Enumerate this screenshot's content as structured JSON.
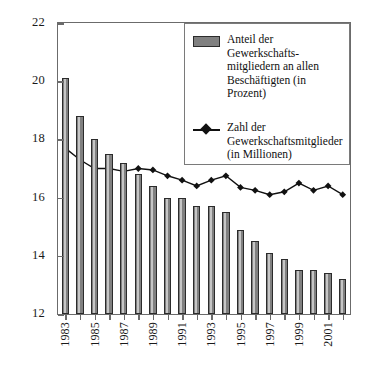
{
  "chart_data": {
    "type": "bar",
    "title": "",
    "subtitle": "",
    "xlabel": "",
    "ylabel": "",
    "ylim": [
      12,
      22
    ],
    "ytick_step": 2,
    "ytick_labels": [
      "12",
      "14",
      "16",
      "18",
      "20",
      "22"
    ],
    "grid": false,
    "legend_position": "top-right-inside",
    "x": [
      1983,
      1984,
      1985,
      1986,
      1987,
      1988,
      1989,
      1990,
      1991,
      1992,
      1993,
      1994,
      1995,
      1996,
      1997,
      1998,
      1999,
      2000,
      2001,
      2002
    ],
    "categories": [
      "1983",
      "1984",
      "1985",
      "1986",
      "1987",
      "1988",
      "1989",
      "1990",
      "1991",
      "1992",
      "1993",
      "1994",
      "1995",
      "1996",
      "1997",
      "1998",
      "1999",
      "2000",
      "2001",
      "2002"
    ],
    "xtick_labels_shown": [
      "1983",
      "1985",
      "1987",
      "1989",
      "1991",
      "1993",
      "1995",
      "1997",
      "1999",
      "2001"
    ],
    "series": [
      {
        "name": "Anteil der Gewerkschaftsmitgliedern an allen Beschäftigten (in Prozent)",
        "type": "bar",
        "unit": "Prozent",
        "color": "#808080",
        "values": [
          20.1,
          18.8,
          18.0,
          17.5,
          17.2,
          16.8,
          16.4,
          16.0,
          16.0,
          15.7,
          15.7,
          15.5,
          14.9,
          14.5,
          14.1,
          13.9,
          13.5,
          13.5,
          13.4,
          13.2
        ]
      },
      {
        "name": "Zahl der Gewerkschaftsmitglieder (in Millionen)",
        "type": "line",
        "unit": "Millionen",
        "color": "#111111",
        "marker": "diamond",
        "values": [
          17.7,
          17.3,
          17.0,
          17.0,
          16.9,
          17.0,
          16.95,
          16.75,
          16.6,
          16.4,
          16.6,
          16.75,
          16.35,
          16.25,
          16.1,
          16.2,
          16.5,
          16.25,
          16.4,
          16.1
        ]
      }
    ]
  },
  "legend": {
    "entries": [
      {
        "icon": "bar-swatch",
        "lines": [
          "Anteil der Gewerkschafts-",
          "mitgliedern an allen",
          "Beschäftigten (in Prozent)"
        ]
      },
      {
        "icon": "line-marker-swatch",
        "lines": [
          "Zahl der",
          "Gewerkschaftsmitglieder",
          "(in Millionen)"
        ]
      }
    ]
  },
  "colors": {
    "bar_fill": "#808080",
    "bar_edge": "#2b2b2b",
    "line": "#111111",
    "axis": "#6b6b6b",
    "background": "#ffffff"
  }
}
